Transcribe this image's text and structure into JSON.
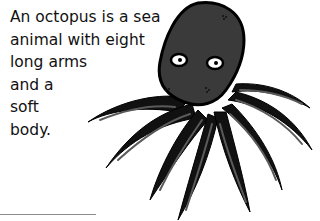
{
  "document": {
    "text_lines": [
      "An octopus is a sea",
      "animal with eight",
      "long arms",
      "and a",
      "soft",
      "body."
    ]
  },
  "illustration": {
    "subject": "octopus",
    "icon": "octopus-illustration",
    "colors": {
      "body": "#3a3a3a",
      "outline": "#000000",
      "tentacle_highlight": "#5a5a5a",
      "eye_white": "#ffffff",
      "pupil": "#000000"
    }
  },
  "footer_rule": {
    "color": "#8a8a8a"
  }
}
